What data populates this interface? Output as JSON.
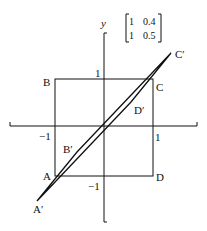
{
  "diagram": {
    "axis_label_y": "y",
    "matrix": {
      "row1": [
        "1",
        "0.4"
      ],
      "row2": [
        "1",
        "0.5"
      ]
    },
    "ticks": {
      "y_pos": "1",
      "y_neg": "−1",
      "x_pos": "1",
      "x_neg": "−1"
    },
    "points": {
      "A": "A",
      "B": "B",
      "C": "C",
      "D": "D",
      "A_prime": "A′",
      "B_prime": "B′",
      "C_prime": "C′",
      "D_prime": "D′"
    },
    "colors": {
      "stroke": "#111111",
      "background": "#ffffff"
    }
  }
}
